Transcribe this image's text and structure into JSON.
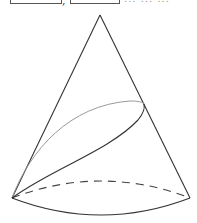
{
  "header": {
    "answer_boxes": [
      "",
      ""
    ],
    "separator": ",",
    "cropped_text": "... ... ..."
  },
  "figure": {
    "type": "cone-with-plane-section",
    "apex": [
      100,
      15
    ],
    "base_left": [
      12,
      198
    ],
    "base_right": [
      190,
      198
    ],
    "base_front_bottom_y": 215,
    "base_back_top_y": 182,
    "section_curve_right_end": [
      144,
      104
    ],
    "colors": {
      "outline": "#333333",
      "back_curve": "#999999",
      "dashed": "#444444"
    }
  }
}
